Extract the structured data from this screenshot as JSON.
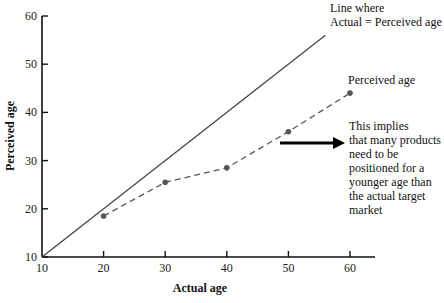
{
  "chart_data": {
    "type": "line",
    "title": "",
    "xlabel": "Actual age",
    "ylabel": "Perceived age",
    "xlim": [
      10,
      65
    ],
    "ylim": [
      10,
      60
    ],
    "x_ticks": [
      10,
      20,
      30,
      40,
      50,
      60
    ],
    "y_ticks": [
      10,
      20,
      30,
      40,
      50,
      60
    ],
    "grid": false,
    "series": [
      {
        "name": "Line where Actual = Perceived age",
        "style": "solid",
        "x": [
          10,
          56
        ],
        "y": [
          10,
          56
        ]
      },
      {
        "name": "Perceived age",
        "style": "dashed",
        "markers": true,
        "x": [
          20,
          30,
          40,
          50,
          60
        ],
        "y": [
          18.5,
          25.5,
          28.5,
          36,
          44
        ]
      }
    ],
    "annotations": [
      {
        "text_lines": [
          "Line where",
          "Actual = Perceived age"
        ]
      },
      {
        "text_lines": [
          "Perceived age"
        ]
      },
      {
        "text_lines": [
          "This implies",
          "that many products",
          "need to be",
          "positioned for a",
          "younger age than",
          "the actual target",
          "market"
        ],
        "arrow": "right"
      }
    ]
  },
  "labels": {
    "xlabel": "Actual age",
    "ylabel": "Perceived age",
    "line_label_1": "Line where",
    "line_label_2": "Actual = Perceived age",
    "series_label": "Perceived age",
    "note": [
      "This implies",
      "that many products",
      "need to be",
      "positioned for a",
      "younger age than",
      "the actual target",
      "market"
    ],
    "x_ticks": [
      "10",
      "20",
      "30",
      "40",
      "50",
      "60"
    ],
    "y_ticks": [
      "10",
      "20",
      "30",
      "40",
      "50",
      "60"
    ]
  }
}
